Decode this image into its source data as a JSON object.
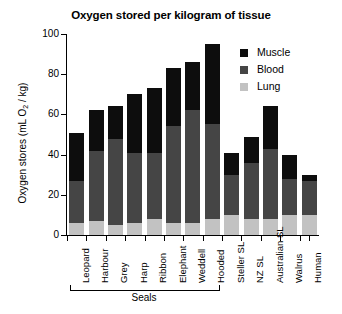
{
  "chart_data": {
    "type": "bar",
    "subtype": "stacked-bar",
    "title": "Oxygen stored per kilogram of tissue",
    "xlabel": "",
    "ylabel": "Oxygen stores (mL O2 / kg)",
    "ylabel_parts": {
      "pre": "Oxygen stores (mL O",
      "sub": "2",
      "post": " / kg)"
    },
    "ylim": [
      0,
      100
    ],
    "yticks": [
      0,
      20,
      40,
      60,
      80,
      100
    ],
    "ytick_labels": [
      "0",
      "20",
      "40",
      "60",
      "80",
      "100"
    ],
    "grid": false,
    "legend_position": "top-right",
    "categories": [
      "Leopard",
      "Harbour",
      "Grey",
      "Harp",
      "Ribbon",
      "Elephant",
      "Weddell",
      "Hooded",
      "Steller SL",
      "NZ SL",
      "Australian SL",
      "Walrus",
      "Human"
    ],
    "series": [
      {
        "name": "Lung",
        "color": "#c2c2c2",
        "values": [
          6,
          7,
          5,
          6,
          8,
          6,
          6,
          8,
          10,
          8,
          8,
          10,
          10
        ]
      },
      {
        "name": "Blood",
        "color": "#454545",
        "values": [
          21,
          35,
          43,
          35,
          33,
          48,
          56,
          47,
          20,
          28,
          35,
          18,
          17
        ]
      },
      {
        "name": "Muscle",
        "color": "#0d0d0d",
        "values": [
          24,
          20,
          16,
          29,
          32,
          29,
          24,
          40,
          11,
          13,
          21,
          12,
          3
        ]
      }
    ],
    "totals": [
      51,
      62,
      64,
      70,
      73,
      83,
      86,
      95,
      41,
      49,
      64,
      40,
      30
    ],
    "group_annotation": {
      "label": "Seals",
      "spans_categories": [
        "Leopard",
        "Hooded"
      ]
    }
  },
  "legend": {
    "items": [
      {
        "label": "Muscle",
        "color": "#0d0d0d"
      },
      {
        "label": "Blood",
        "color": "#454545"
      },
      {
        "label": "Lung",
        "color": "#c2c2c2"
      }
    ]
  }
}
